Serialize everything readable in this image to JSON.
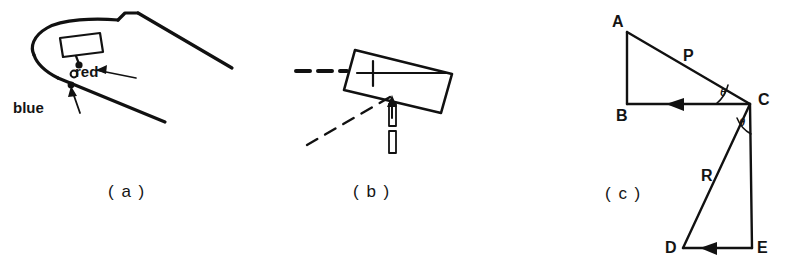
{
  "figure": {
    "background_color": "#ffffff",
    "ink_color": "#111111",
    "panels": [
      {
        "id": "a",
        "caption": "( a )",
        "description": "wing-section-outline-with-marker-device",
        "labels": [
          {
            "name": "red",
            "text": "red"
          },
          {
            "name": "blue",
            "text": "blue"
          }
        ]
      },
      {
        "id": "b",
        "caption": "( b )",
        "description": "tilted-plate-with-crosshair-and-pin",
        "labels": []
      },
      {
        "id": "c",
        "caption": "( c )",
        "description": "vector-triangle-geometry",
        "points": [
          {
            "name": "A",
            "text": "A"
          },
          {
            "name": "B",
            "text": "B"
          },
          {
            "name": "C",
            "text": "C"
          },
          {
            "name": "D",
            "text": "D"
          },
          {
            "name": "E",
            "text": "E"
          }
        ],
        "vectors": [
          {
            "name": "P",
            "text": "P"
          },
          {
            "name": "R",
            "text": "R"
          }
        ],
        "angles": [
          {
            "name": "theta-upper",
            "text": "θ"
          },
          {
            "name": "theta-lower",
            "text": "θ"
          }
        ]
      }
    ]
  }
}
